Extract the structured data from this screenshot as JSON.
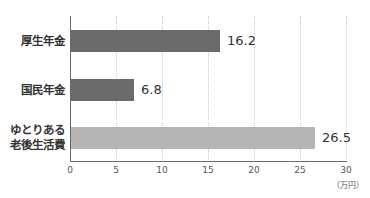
{
  "chart_data": {
    "type": "bar",
    "orientation": "horizontal",
    "categories": [
      "厚生年金",
      "国民年金",
      "ゆとりある老後生活費"
    ],
    "category_lines": [
      [
        "厚生年金"
      ],
      [
        "国民年金"
      ],
      [
        "ゆとりある",
        "老後生活費"
      ]
    ],
    "values": [
      16.2,
      6.8,
      26.5
    ],
    "value_labels": [
      "16.2",
      "6.8",
      "26.5"
    ],
    "bar_colors": [
      "#6b6b6b",
      "#6b6b6b",
      "#b5b5b5"
    ],
    "title": "",
    "xlabel": "",
    "unit_label": "（万円）",
    "xlim": [
      0,
      30
    ],
    "xticks": [
      "0",
      "5",
      "10",
      "15",
      "20",
      "25",
      "30"
    ],
    "grid": true,
    "legend": null
  }
}
